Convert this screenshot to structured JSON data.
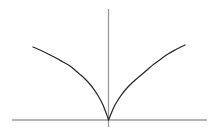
{
  "figure": {
    "width": 217,
    "height": 140,
    "background_color": "#ffffff",
    "title": "",
    "caption": ""
  },
  "style": {
    "axis_color": "#9a9a9a",
    "axis_width": 1.3,
    "curve_color": "#2b2b2b",
    "curve_width": 1.25
  },
  "axes": {
    "x_axis": {
      "name": "x-axis",
      "y_pixel": 120,
      "x_start_pixel": 12,
      "x_end_pixel": 207,
      "label": "",
      "ticks": [],
      "tick_labels": []
    },
    "y_axis": {
      "name": "y-axis",
      "x_pixel": 108.5,
      "y_start_pixel": 9,
      "y_end_pixel": 127,
      "label": "",
      "ticks": [],
      "tick_labels": []
    },
    "origin_pixel": [
      108.5,
      120
    ]
  },
  "chart_data": {
    "type": "line",
    "title": "",
    "xlabel": "",
    "ylabel": "",
    "grid": false,
    "legend": "none",
    "xlim": [
      -2.6,
      2.2
    ],
    "ylim": [
      -0.2,
      1.6
    ],
    "annotations": [
      "vertical tangent (cusp) at the origin",
      "curve touches x-axis only at x = 0"
    ],
    "series": [
      {
        "name": "y = |x|^(1/3) (left branch)",
        "comment": "pixel path of the left branch, sampled left-to-right",
        "points_pixel": [
          [
            33,
            47
          ],
          [
            40,
            50
          ],
          [
            48,
            54
          ],
          [
            56,
            58
          ],
          [
            63,
            62
          ],
          [
            70,
            66
          ],
          [
            76,
            71
          ],
          [
            82,
            76
          ],
          [
            88,
            82
          ],
          [
            93,
            88
          ],
          [
            97,
            94
          ],
          [
            100,
            99
          ],
          [
            103,
            105
          ],
          [
            105,
            110
          ],
          [
            106.5,
            114
          ],
          [
            107.6,
            117
          ],
          [
            108.2,
            119
          ],
          [
            108.5,
            120
          ]
        ],
        "x": [
          -2.55,
          -2.25,
          -1.95,
          -1.65,
          -1.38,
          -1.12,
          -0.9,
          -0.7,
          -0.52,
          -0.37,
          -0.26,
          -0.18,
          -0.11,
          -0.06,
          -0.032,
          -0.013,
          -0.004,
          0
        ],
        "y": [
          1.47,
          1.41,
          1.34,
          1.27,
          1.2,
          1.12,
          1.05,
          0.97,
          0.88,
          0.78,
          0.68,
          0.59,
          0.47,
          0.36,
          0.25,
          0.16,
          0.08,
          0
        ]
      },
      {
        "name": "y = |x|^(1/3) (right branch)",
        "comment": "pixel path of the right branch, sampled left-to-right",
        "points_pixel": [
          [
            108.5,
            120
          ],
          [
            109,
            119
          ],
          [
            109.8,
            117
          ],
          [
            111,
            114
          ],
          [
            112.6,
            110
          ],
          [
            115,
            105
          ],
          [
            118,
            100
          ],
          [
            122,
            94
          ],
          [
            127,
            88
          ],
          [
            133,
            82
          ],
          [
            140,
            76
          ],
          [
            147,
            70
          ],
          [
            154,
            64
          ],
          [
            161,
            59
          ],
          [
            168,
            54
          ],
          [
            175,
            50
          ],
          [
            182,
            46.5
          ],
          [
            185,
            45
          ]
        ],
        "x": [
          0,
          0.004,
          0.013,
          0.032,
          0.06,
          0.11,
          0.18,
          0.27,
          0.38,
          0.53,
          0.72,
          0.93,
          1.14,
          1.36,
          1.58,
          1.8,
          2.0,
          2.08
        ],
        "y": [
          0,
          0.08,
          0.16,
          0.25,
          0.36,
          0.47,
          0.58,
          0.68,
          0.78,
          0.88,
          0.97,
          1.06,
          1.14,
          1.21,
          1.28,
          1.34,
          1.4,
          1.43
        ]
      }
    ]
  }
}
